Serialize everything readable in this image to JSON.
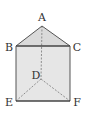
{
  "diagram": {
    "type": "triangular-prism",
    "vertices": {
      "A": {
        "label": "A",
        "x": 42,
        "y": 26,
        "lx": 42,
        "ly": 21
      },
      "B": {
        "label": "B",
        "x": 16,
        "y": 46,
        "lx": 9,
        "ly": 51
      },
      "C": {
        "label": "C",
        "x": 70,
        "y": 46,
        "lx": 76,
        "ly": 51
      },
      "D": {
        "label": "D",
        "x": 41,
        "y": 79,
        "lx": 36,
        "ly": 78
      },
      "E": {
        "label": "E",
        "x": 16,
        "y": 101,
        "lx": 9,
        "ly": 105
      },
      "F": {
        "label": "F",
        "x": 70,
        "y": 101,
        "lx": 76,
        "ly": 105
      }
    },
    "solid_edges": [
      "AB",
      "AC",
      "BC",
      "BE",
      "CF",
      "EF"
    ],
    "hidden_edges": [
      "AD",
      "DE",
      "DF"
    ],
    "colors": {
      "fill": "#e4e4e4",
      "top_fill": "#d8d8d8",
      "edge": "#555555",
      "hidden_edge": "#777777",
      "label": "#333333"
    }
  }
}
